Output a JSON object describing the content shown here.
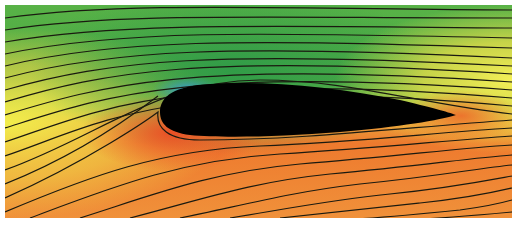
{
  "figure": {
    "colors": {
      "background": "#ffffff",
      "low_pressure_dark": "#2f8f3a",
      "low_pressure_mid": "#4fae45",
      "suction_peak": "#3a9ad8",
      "neutral_yellow": "#f2ec4a",
      "high_pressure": "#ee6a2a",
      "high_pressure_light": "#f09030",
      "airfoil": "#000000",
      "streamline": "#1a1a10"
    },
    "plot_area": {
      "x": 5,
      "y": 5,
      "width": 507,
      "height": 213
    },
    "airfoil": {
      "leading_edge": [
        160,
        112
      ],
      "trailing_edge": [
        456,
        115
      ],
      "upper_max_y": 83,
      "lower_max_y": 137
    },
    "streamline_count_above": 14,
    "streamline_count_below": 13
  }
}
